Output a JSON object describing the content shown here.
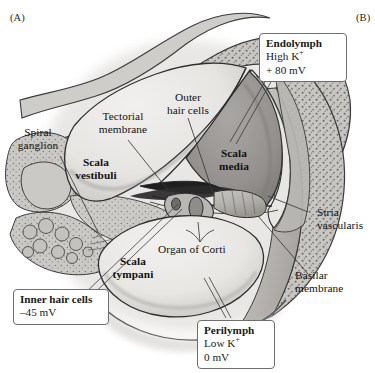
{
  "figure": {
    "panel_a": "(A)",
    "panel_b": "(B)"
  },
  "labels": {
    "spiral_ganglion": "Spiral\nganglion",
    "tectorial_membrane": "Tectorial\nmembrane",
    "outer_hair_cells": "Outer\nhair cells",
    "scala_vestibuli": "Scala\nvestibuli",
    "scala_media": "Scala\nmedia",
    "scala_tympani": "Scala\ntympani",
    "organ_of_corti": "Organ of Corti",
    "stria_vascularis": "Stria\nvascularis",
    "basilar_membrane": "Basilar\nmembrane"
  },
  "callouts": {
    "endolymph": {
      "title": "Endolymph",
      "line1": "High K",
      "line1_sup": "+",
      "line2": "+ 80 mV"
    },
    "perilymph": {
      "title": "Perilymph",
      "line1": "Low K",
      "line1_sup": "+",
      "line2": "0 mV"
    },
    "inner_hair_cells": {
      "title": "Inner hair cells",
      "line1": "–45 mV"
    }
  },
  "colors": {
    "background": "#ffffff",
    "bone_fill": "#c8c6c2",
    "bone_stipple": "#6f6d6a",
    "scala_lumen": "#e9e8e5",
    "scala_media_fill": "#9b9996",
    "soft_tissue": "#b6b4b0",
    "outline": "#2b2b2b",
    "dark_accent": "#2a2a2a",
    "callout_border": "#6e6e6e",
    "leader_line": "#3a3a3a"
  }
}
